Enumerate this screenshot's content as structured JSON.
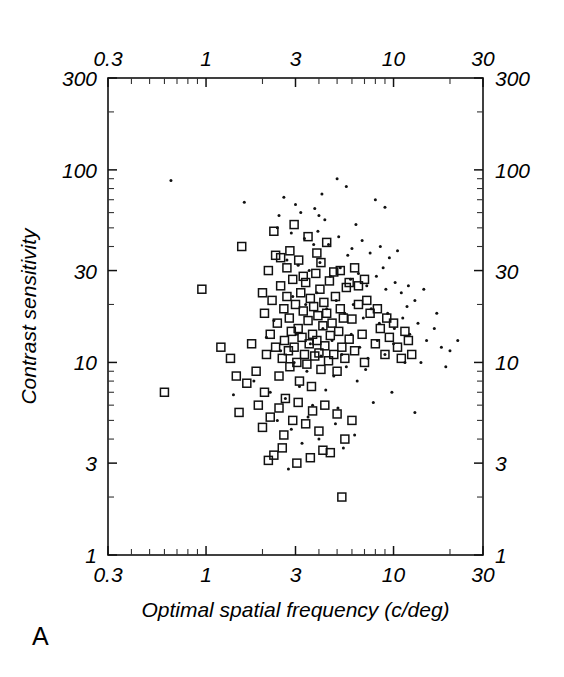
{
  "figure": {
    "panel_label": "A",
    "background_color": "#ffffff",
    "ink_color": "#111111"
  },
  "chart_data": {
    "type": "scatter",
    "title": "",
    "xlabel": "Optimal spatial frequency (c/deg)",
    "ylabel": "Contrast sensitivity",
    "xscale": "log",
    "yscale": "log",
    "xlim": [
      0.3,
      30
    ],
    "ylim": [
      1,
      300
    ],
    "grid": false,
    "legend": "none",
    "axes": {
      "top_axis_labels": [
        "0.3",
        "1",
        "3",
        "10",
        "30"
      ],
      "bottom_axis_labels": [
        "0.3",
        "1",
        "3",
        "10",
        "30"
      ],
      "left_axis_labels": [
        "300",
        "100",
        "30",
        "10",
        "3",
        "1"
      ],
      "right_axis_labels": [
        "300",
        "100",
        "30",
        "10",
        "3",
        "1"
      ],
      "x_major_ticks": [
        0.3,
        1,
        3,
        10,
        30
      ],
      "y_major_ticks": [
        1,
        3,
        10,
        30,
        100,
        300
      ],
      "ticks_direction": "inward",
      "frame": "full-box"
    },
    "series": [
      {
        "name": "open squares",
        "marker": "open-square",
        "marker_size_px": 8,
        "points": [
          [
            0.6,
            7.0
          ],
          [
            0.95,
            24.0
          ],
          [
            1.55,
            40.0
          ],
          [
            1.75,
            12.5
          ],
          [
            1.85,
            9.0
          ],
          [
            1.9,
            6.0
          ],
          [
            2.0,
            4.6
          ],
          [
            2.05,
            18.0
          ],
          [
            2.1,
            11.0
          ],
          [
            2.15,
            30.0
          ],
          [
            2.2,
            14.0
          ],
          [
            2.25,
            21.0
          ],
          [
            2.3,
            3.3
          ],
          [
            2.35,
            12.0
          ],
          [
            2.4,
            16.0
          ],
          [
            2.45,
            8.5
          ],
          [
            2.5,
            25.0
          ],
          [
            2.55,
            10.5
          ],
          [
            2.6,
            19.0
          ],
          [
            2.62,
            13.0
          ],
          [
            2.65,
            6.5
          ],
          [
            2.7,
            22.0
          ],
          [
            2.75,
            11.5
          ],
          [
            2.78,
            17.0
          ],
          [
            2.8,
            9.5
          ],
          [
            2.85,
            14.5
          ],
          [
            2.9,
            27.0
          ],
          [
            2.95,
            12.0
          ],
          [
            3.0,
            20.0
          ],
          [
            3.05,
            10.0
          ],
          [
            3.1,
            15.0
          ],
          [
            3.12,
            34.0
          ],
          [
            3.15,
            8.0
          ],
          [
            3.2,
            23.0
          ],
          [
            3.25,
            13.5
          ],
          [
            3.3,
            18.5
          ],
          [
            3.35,
            11.0
          ],
          [
            3.4,
            26.0
          ],
          [
            3.45,
            9.8
          ],
          [
            3.5,
            16.5
          ],
          [
            3.55,
            12.5
          ],
          [
            3.6,
            21.5
          ],
          [
            3.65,
            7.5
          ],
          [
            3.7,
            14.0
          ],
          [
            3.75,
            19.5
          ],
          [
            3.8,
            10.8
          ],
          [
            3.85,
            29.0
          ],
          [
            3.9,
            13.0
          ],
          [
            3.95,
            17.5
          ],
          [
            4.0,
            11.2
          ],
          [
            4.05,
            24.0
          ],
          [
            4.1,
            9.2
          ],
          [
            4.2,
            15.5
          ],
          [
            4.25,
            20.5
          ],
          [
            4.3,
            12.2
          ],
          [
            4.4,
            18.0
          ],
          [
            4.5,
            10.2
          ],
          [
            4.55,
            26.5
          ],
          [
            4.6,
            13.8
          ],
          [
            4.7,
            16.0
          ],
          [
            4.8,
            11.0
          ],
          [
            4.9,
            22.0
          ],
          [
            5.0,
            9.0
          ],
          [
            5.1,
            14.5
          ],
          [
            5.2,
            19.0
          ],
          [
            5.3,
            12.0
          ],
          [
            5.4,
            17.0
          ],
          [
            5.5,
            10.5
          ],
          [
            5.6,
            24.5
          ],
          [
            5.8,
            13.2
          ],
          [
            6.0,
            16.8
          ],
          [
            6.2,
            11.5
          ],
          [
            6.5,
            20.0
          ],
          [
            6.8,
            14.0
          ],
          [
            7.0,
            10.0
          ],
          [
            7.5,
            18.0
          ],
          [
            8.0,
            12.5
          ],
          [
            8.5,
            15.0
          ],
          [
            9.0,
            11.0
          ],
          [
            9.5,
            13.5
          ],
          [
            10.0,
            16.0
          ],
          [
            10.5,
            12.0
          ],
          [
            11.0,
            10.5
          ],
          [
            12.0,
            13.0
          ],
          [
            1.5,
            5.5
          ],
          [
            1.65,
            7.8
          ],
          [
            2.05,
            7.0
          ],
          [
            2.2,
            5.2
          ],
          [
            2.45,
            5.8
          ],
          [
            2.6,
            4.2
          ],
          [
            2.9,
            5.0
          ],
          [
            3.1,
            6.2
          ],
          [
            3.4,
            4.8
          ],
          [
            3.7,
            5.6
          ],
          [
            4.0,
            4.4
          ],
          [
            4.3,
            6.0
          ],
          [
            4.6,
            3.4
          ],
          [
            5.0,
            5.4
          ],
          [
            5.5,
            4.0
          ],
          [
            6.0,
            5.0
          ],
          [
            2.15,
            3.1
          ],
          [
            2.55,
            3.6
          ],
          [
            3.05,
            3.0
          ],
          [
            3.6,
            3.2
          ],
          [
            4.2,
            3.5
          ],
          [
            5.3,
            2.0
          ],
          [
            1.35,
            10.5
          ],
          [
            1.45,
            8.5
          ],
          [
            1.2,
            12.0
          ],
          [
            2.35,
            36.0
          ],
          [
            2.7,
            31.0
          ],
          [
            3.3,
            28.0
          ],
          [
            4.1,
            33.0
          ],
          [
            4.8,
            29.5
          ],
          [
            2.0,
            23.0
          ],
          [
            2.5,
            35.0
          ],
          [
            6.5,
            25.0
          ],
          [
            7.2,
            21.0
          ],
          [
            8.2,
            19.0
          ],
          [
            9.2,
            17.0
          ],
          [
            2.8,
            38.0
          ],
          [
            3.5,
            45.0
          ],
          [
            3.9,
            37.0
          ],
          [
            5.2,
            30.0
          ],
          [
            2.3,
            48.0
          ],
          [
            2.95,
            52.0
          ],
          [
            4.4,
            42.0
          ],
          [
            5.8,
            26.0
          ],
          [
            6.2,
            31.0
          ],
          [
            7.0,
            27.0
          ],
          [
            11.5,
            14.5
          ],
          [
            12.5,
            11.0
          ]
        ]
      },
      {
        "name": "filled dots",
        "marker": "filled-dot",
        "marker_size_px": 3,
        "points": [
          [
            0.65,
            88.0
          ],
          [
            1.6,
            68.0
          ],
          [
            2.6,
            72.0
          ],
          [
            3.0,
            66.0
          ],
          [
            3.2,
            60.0
          ],
          [
            3.8,
            63.0
          ],
          [
            4.0,
            58.0
          ],
          [
            4.3,
            55.0
          ],
          [
            5.0,
            90.0
          ],
          [
            5.6,
            82.0
          ],
          [
            8.0,
            70.0
          ],
          [
            9.0,
            64.0
          ],
          [
            2.4,
            50.0
          ],
          [
            2.85,
            47.0
          ],
          [
            3.35,
            44.0
          ],
          [
            3.95,
            48.0
          ],
          [
            4.5,
            41.0
          ],
          [
            5.1,
            45.0
          ],
          [
            6.0,
            39.0
          ],
          [
            6.8,
            43.0
          ],
          [
            7.5,
            37.0
          ],
          [
            8.5,
            40.0
          ],
          [
            9.5,
            35.0
          ],
          [
            10.5,
            38.0
          ],
          [
            2.7,
            34.0
          ],
          [
            3.1,
            32.0
          ],
          [
            3.55,
            30.0
          ],
          [
            4.05,
            33.0
          ],
          [
            4.6,
            28.0
          ],
          [
            5.2,
            31.0
          ],
          [
            5.9,
            27.0
          ],
          [
            6.5,
            29.0
          ],
          [
            7.2,
            25.0
          ],
          [
            8.1,
            28.0
          ],
          [
            9.1,
            24.0
          ],
          [
            10.2,
            26.0
          ],
          [
            11.0,
            23.0
          ],
          [
            12.0,
            25.0
          ],
          [
            13.0,
            21.0
          ],
          [
            14.5,
            24.0
          ],
          [
            2.9,
            22.0
          ],
          [
            3.4,
            20.0
          ],
          [
            3.9,
            23.0
          ],
          [
            4.4,
            19.0
          ],
          [
            4.95,
            21.0
          ],
          [
            5.5,
            18.0
          ],
          [
            6.1,
            20.0
          ],
          [
            6.9,
            17.0
          ],
          [
            7.6,
            19.0
          ],
          [
            8.4,
            16.0
          ],
          [
            9.3,
            18.0
          ],
          [
            10.1,
            15.0
          ],
          [
            11.2,
            17.0
          ],
          [
            12.2,
            14.0
          ],
          [
            13.5,
            16.0
          ],
          [
            15.0,
            13.0
          ],
          [
            16.5,
            15.0
          ],
          [
            18.0,
            12.0
          ],
          [
            20.0,
            11.5
          ],
          [
            22.0,
            13.0
          ],
          [
            3.05,
            14.0
          ],
          [
            3.6,
            12.5
          ],
          [
            4.2,
            15.0
          ],
          [
            4.7,
            13.0
          ],
          [
            5.3,
            11.0
          ],
          [
            5.95,
            14.0
          ],
          [
            6.6,
            12.0
          ],
          [
            7.3,
            10.5
          ],
          [
            8.2,
            13.0
          ],
          [
            9.0,
            11.0
          ],
          [
            10.0,
            12.5
          ],
          [
            11.5,
            10.0
          ],
          [
            2.5,
            11.5
          ],
          [
            2.95,
            10.0
          ],
          [
            3.45,
            9.0
          ],
          [
            4.1,
            10.8
          ],
          [
            4.8,
            8.5
          ],
          [
            5.6,
            9.5
          ],
          [
            6.4,
            8.0
          ],
          [
            7.1,
            9.2
          ],
          [
            1.8,
            8.0
          ],
          [
            2.2,
            7.0
          ],
          [
            2.65,
            6.5
          ],
          [
            3.15,
            7.5
          ],
          [
            3.7,
            6.0
          ],
          [
            4.35,
            7.2
          ],
          [
            5.05,
            5.8
          ],
          [
            2.4,
            5.0
          ],
          [
            2.85,
            4.5
          ],
          [
            3.5,
            5.2
          ],
          [
            4.0,
            4.0
          ],
          [
            4.9,
            4.8
          ],
          [
            6.2,
            4.2
          ],
          [
            13.0,
            5.5
          ],
          [
            2.1,
            13.5
          ],
          [
            2.3,
            16.5
          ],
          [
            1.4,
            6.8
          ],
          [
            2.75,
            2.8
          ],
          [
            3.25,
            3.8
          ],
          [
            5.4,
            3.6
          ],
          [
            17.0,
            18.0
          ],
          [
            19.0,
            9.5
          ],
          [
            7.8,
            6.2
          ],
          [
            9.8,
            7.0
          ],
          [
            2.45,
            58.0
          ],
          [
            4.15,
            75.0
          ],
          [
            6.3,
            52.0
          ],
          [
            3.75,
            41.0
          ],
          [
            5.7,
            36.0
          ],
          [
            8.8,
            31.0
          ],
          [
            11.8,
            19.5
          ],
          [
            14.0,
            10.0
          ]
        ]
      }
    ]
  }
}
